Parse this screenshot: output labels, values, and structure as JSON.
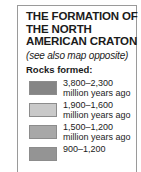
{
  "panel": {
    "title_lines": [
      "THE FORMATION OF",
      "THE NORTH",
      "AMERICAN CRATON"
    ],
    "subtitle": "(see also map opposite)",
    "legend_heading": "Rocks formed:",
    "border_color": "#9a9a9a",
    "text_color": "#1b1b1b"
  },
  "legend": {
    "items": [
      {
        "range": "3,800–2,300",
        "unit": "million years ago",
        "color": "#858585"
      },
      {
        "range": "1,900–1,600",
        "unit": "million years ago",
        "color": "#c9c9c9"
      },
      {
        "range": "1,500–1,200",
        "unit": "million years ago",
        "color": "#a8a8a8"
      },
      {
        "range": "900–1,200",
        "unit": "",
        "color": "#949494"
      }
    ]
  }
}
